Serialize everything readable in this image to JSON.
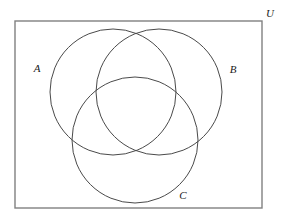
{
  "figure": {
    "type": "venn-diagram",
    "background_color": "#ffffff",
    "stroke_color": "#4a4a4a",
    "universe_stroke_color": "#808080",
    "label_color": "#1a1a1a",
    "stroke_width": 1
  },
  "universe": {
    "label": "U",
    "label_x": 270,
    "label_y": 14,
    "rect": {
      "x": 15,
      "y": 21,
      "width": 247,
      "height": 187
    }
  },
  "sets": [
    {
      "id": "A",
      "label": "A",
      "label_x": 37,
      "label_y": 69,
      "circle": {
        "cx": 113,
        "cy": 92,
        "r": 63
      }
    },
    {
      "id": "B",
      "label": "B",
      "label_x": 233,
      "label_y": 70,
      "circle": {
        "cx": 159,
        "cy": 92,
        "r": 63
      }
    },
    {
      "id": "C",
      "label": "C",
      "label_x": 183,
      "label_y": 196,
      "circle": {
        "cx": 135,
        "cy": 140,
        "r": 63
      }
    }
  ]
}
